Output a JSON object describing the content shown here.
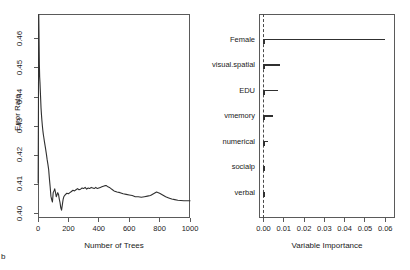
{
  "figure": {
    "corner_letter": "b",
    "background": "#ffffff",
    "line_color": "#303030",
    "axis_color": "#5a5a5a"
  },
  "chart_data": [
    {
      "type": "line",
      "panel": "left",
      "title": "",
      "xlabel": "Number of Trees",
      "ylabel": "Error Rate",
      "xlim": [
        0,
        1000
      ],
      "ylim": [
        0.3985,
        0.4685
      ],
      "xticks": [
        0,
        200,
        400,
        600,
        800,
        1000
      ],
      "xtick_labels": [
        "0",
        "200",
        "400",
        "600",
        "800",
        "1000"
      ],
      "yticks": [
        0.4,
        0.41,
        0.42,
        0.43,
        0.44,
        0.45,
        0.46
      ],
      "ytick_labels": [
        "0.40",
        "0.41",
        "0.42",
        "0.43",
        "0.44",
        "0.45",
        "0.46"
      ],
      "grid": false,
      "legend": false,
      "series": [
        {
          "name": "OOB error rate",
          "x": [
            1,
            3,
            5,
            7,
            9,
            11,
            13,
            15,
            17,
            20,
            23,
            26,
            29,
            32,
            35,
            38,
            42,
            46,
            50,
            55,
            60,
            65,
            70,
            75,
            80,
            85,
            90,
            95,
            100,
            105,
            110,
            115,
            120,
            125,
            130,
            135,
            140,
            145,
            150,
            155,
            160,
            165,
            170,
            175,
            180,
            190,
            200,
            210,
            220,
            230,
            240,
            250,
            260,
            270,
            280,
            290,
            300,
            310,
            320,
            330,
            340,
            350,
            360,
            370,
            380,
            390,
            400,
            410,
            420,
            430,
            440,
            450,
            460,
            470,
            480,
            490,
            500,
            520,
            540,
            560,
            580,
            600,
            620,
            640,
            660,
            680,
            700,
            720,
            740,
            760,
            780,
            800,
            820,
            840,
            860,
            880,
            900,
            920,
            940,
            960,
            980,
            1000
          ],
          "y": [
            0.4105,
            0.438,
            0.4682,
            0.46,
            0.4512,
            0.447,
            0.445,
            0.4425,
            0.44,
            0.4362,
            0.4338,
            0.4318,
            0.43,
            0.4285,
            0.4272,
            0.4262,
            0.4248,
            0.4235,
            0.4222,
            0.4205,
            0.4186,
            0.417,
            0.4152,
            0.412,
            0.4092,
            0.406,
            0.4048,
            0.404,
            0.4072,
            0.4078,
            0.4085,
            0.4073,
            0.4058,
            0.4065,
            0.4072,
            0.4066,
            0.405,
            0.4038,
            0.402,
            0.4012,
            0.403,
            0.4048,
            0.4058,
            0.4062,
            0.4065,
            0.407,
            0.4068,
            0.4072,
            0.4076,
            0.408,
            0.4078,
            0.4082,
            0.4086,
            0.4082,
            0.4084,
            0.4088,
            0.4086,
            0.409,
            0.4084,
            0.4088,
            0.4086,
            0.409,
            0.4088,
            0.4086,
            0.409,
            0.4086,
            0.4088,
            0.409,
            0.4092,
            0.4094,
            0.4096,
            0.4096,
            0.4092,
            0.409,
            0.4086,
            0.4082,
            0.4078,
            0.4074,
            0.4072,
            0.4068,
            0.4066,
            0.4064,
            0.4062,
            0.4058,
            0.4058,
            0.4056,
            0.4058,
            0.406,
            0.4062,
            0.4068,
            0.4074,
            0.407,
            0.4064,
            0.4058,
            0.4054,
            0.405,
            0.4048,
            0.4046,
            0.4045,
            0.4044,
            0.4044,
            0.4044
          ]
        }
      ]
    },
    {
      "type": "bar",
      "panel": "right",
      "orientation": "horizontal",
      "title": "",
      "xlabel": "Variable Importance",
      "ylabel": "",
      "xlim": [
        -0.0022,
        0.0648
      ],
      "xticks": [
        0.0,
        0.01,
        0.02,
        0.03,
        0.04,
        0.05,
        0.06
      ],
      "xtick_labels": [
        "0.00",
        "0.01",
        "0.02",
        "0.03",
        "0.04",
        "0.05",
        "0.06"
      ],
      "reference_line": 0.0,
      "reference_line_style": "dashed",
      "grid": false,
      "legend": false,
      "categories": [
        "Female",
        "visual.spatial",
        "EDU",
        "vmemory",
        "numerical",
        "socialp",
        "verbal"
      ],
      "values": [
        0.06,
        0.0082,
        0.0072,
        0.0045,
        0.0022,
        0.0005,
        0.0001
      ]
    }
  ]
}
